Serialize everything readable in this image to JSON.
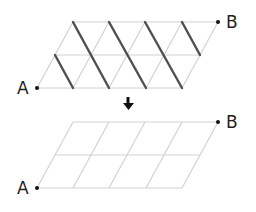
{
  "colors": {
    "thin_line": "#d2d2d2",
    "thick_line": "#505050",
    "point": "#111111",
    "label": "#222222",
    "arrow": "#111111"
  },
  "top_figure": {
    "start_label": "A",
    "end_label": "B",
    "columns": 4,
    "rows": 2,
    "description": "Parallelogram lattice of triangles with thick descending segments"
  },
  "arrow": {
    "direction": "down",
    "icon": "down-arrow-icon"
  },
  "bottom_figure": {
    "start_label": "A",
    "end_label": "B",
    "columns": 4,
    "rows": 2,
    "description": "Parallelogram grid of 4x2 cells"
  }
}
